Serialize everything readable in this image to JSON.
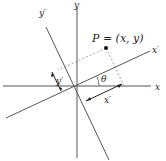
{
  "diagram": {
    "labels": {
      "x_axis": "x",
      "y_axis": "y",
      "x_prime_axis": "x′",
      "y_prime_axis": "y′",
      "point": "P = (x, y)",
      "angle": "θ",
      "x_prime_length": "x′",
      "y_prime_length": "y′"
    },
    "colors": {
      "axis": "#555555",
      "dashed": "#888888",
      "point": "#111111",
      "text": "#222222"
    }
  }
}
